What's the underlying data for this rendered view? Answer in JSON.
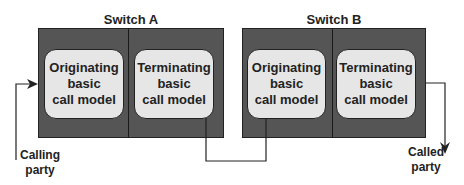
{
  "diagram": {
    "switches": [
      {
        "title": "Switch A",
        "models": [
          {
            "lines": [
              "Originating",
              "basic",
              "call model"
            ]
          },
          {
            "lines": [
              "Terminating",
              "basic",
              "call model"
            ]
          }
        ]
      },
      {
        "title": "Switch B",
        "models": [
          {
            "lines": [
              "Originating",
              "basic",
              "call model"
            ]
          },
          {
            "lines": [
              "Terminating",
              "basic",
              "call model"
            ]
          }
        ]
      }
    ],
    "endpoints": {
      "calling": {
        "lines": [
          "Calling",
          "party"
        ]
      },
      "called": {
        "lines": [
          "Called",
          "party"
        ]
      }
    },
    "colors": {
      "switch_fill": "#555555",
      "model_fill": "#e6e6e6",
      "line": "#222222"
    }
  }
}
